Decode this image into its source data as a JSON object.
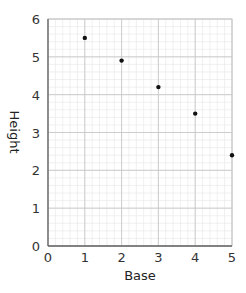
{
  "chart_data": {
    "type": "scatter",
    "title": "",
    "xlabel": "Base",
    "ylabel": "Height",
    "xlim": [
      0,
      5
    ],
    "ylim": [
      0,
      6
    ],
    "x_ticks": [
      "0",
      "1",
      "2",
      "3",
      "4",
      "5"
    ],
    "y_ticks": [
      "0",
      "1",
      "2",
      "3",
      "4",
      "5",
      "6"
    ],
    "grid": true,
    "grid_minor_subdivisions": 5,
    "legend": null,
    "series": [
      {
        "name": "points",
        "x": [
          1,
          2,
          3,
          4,
          5
        ],
        "y": [
          5.5,
          4.9,
          4.2,
          3.5,
          2.4
        ],
        "color": "#111111"
      }
    ]
  },
  "colors": {
    "major_grid": "#c8c8c8",
    "minor_grid": "#e6e6e6",
    "axis": "#666666",
    "point": "#111111"
  }
}
